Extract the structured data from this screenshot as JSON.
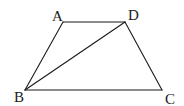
{
  "diagram": {
    "type": "geometry-trapezoid",
    "vertices": [
      {
        "label": "A",
        "x": 63,
        "y": 22,
        "label_x": 52,
        "label_y": 21
      },
      {
        "label": "D",
        "x": 125,
        "y": 22,
        "label_x": 128,
        "label_y": 20
      },
      {
        "label": "B",
        "x": 25,
        "y": 90,
        "label_x": 14,
        "label_y": 102
      },
      {
        "label": "C",
        "x": 162,
        "y": 90,
        "label_x": 165,
        "label_y": 104
      }
    ],
    "edges": [
      {
        "from": "A",
        "to": "D"
      },
      {
        "from": "D",
        "to": "C"
      },
      {
        "from": "C",
        "to": "B"
      },
      {
        "from": "B",
        "to": "A"
      },
      {
        "from": "B",
        "to": "D"
      }
    ],
    "colors": {
      "stroke": "#1a1a1a",
      "background": "#ffffff"
    }
  }
}
